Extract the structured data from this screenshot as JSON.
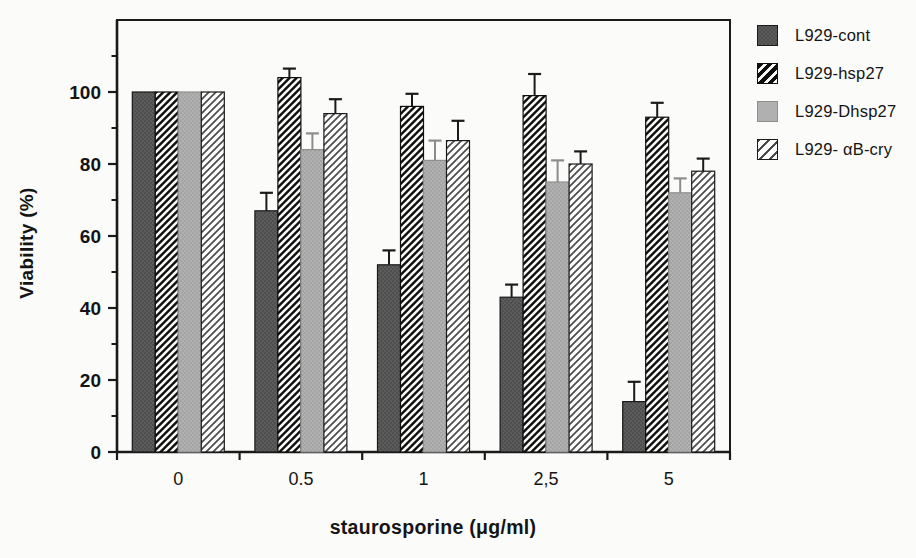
{
  "figure": {
    "background": "#fbfbf9",
    "text_color": "#141414"
  },
  "chart_data": {
    "type": "bar",
    "title": "",
    "xlabel": "staurosporine (μg/ml)",
    "ylabel": "Viability (%)",
    "categories": [
      "0",
      "0.5",
      "1",
      "2,5",
      "5"
    ],
    "series": [
      {
        "name": "L929-cont",
        "pattern": "dark-stipple",
        "fill": "#5c5c5c",
        "edge": "#1a1a1a",
        "error_color": "#1a1a1a",
        "values": [
          100,
          67,
          52,
          43,
          14
        ],
        "errors": [
          0,
          5,
          4,
          3.5,
          5.5
        ]
      },
      {
        "name": "L929-hsp27",
        "pattern": "black-diagonal-hatch",
        "fill": "#0f0f0f",
        "edge": "#0f0f0f",
        "error_color": "#1a1a1a",
        "values": [
          100,
          104,
          96,
          99,
          93
        ],
        "errors": [
          0,
          2.5,
          3.5,
          6,
          4
        ]
      },
      {
        "name": "L929-Dhsp27",
        "pattern": "light-stipple",
        "fill": "#b0b0b0",
        "edge": "#8f8f8f",
        "error_color": "#8c8c8c",
        "values": [
          100,
          84,
          81,
          75,
          72
        ],
        "errors": [
          0,
          4.5,
          5.5,
          6,
          4
        ]
      },
      {
        "name": "L929- αB-cry",
        "pattern": "white-diagonal-hatch",
        "fill": "#fefefe",
        "edge": "#1a1a1a",
        "error_color": "#1a1a1a",
        "values": [
          100,
          94,
          86.5,
          80,
          78
        ],
        "errors": [
          0,
          4,
          5.5,
          3.5,
          3.5
        ]
      }
    ],
    "ylim": [
      0,
      120
    ],
    "yticks_major": [
      0,
      20,
      40,
      60,
      80,
      100
    ],
    "yticks_minor": [
      10,
      30,
      50,
      70,
      90,
      110
    ],
    "grid": false,
    "legend_position": "right",
    "axis_color": "#1a1a1a",
    "bar_width_px": 23
  }
}
